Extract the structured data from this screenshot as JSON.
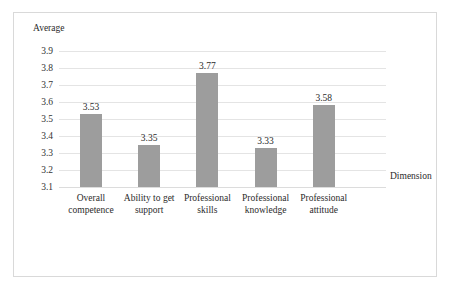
{
  "chart_data": {
    "type": "bar",
    "title": "",
    "subtitle": "",
    "ylabel": "Average",
    "xlabel": "Dimension",
    "categories": [
      "Overall competence",
      "Ability to get support",
      "Professional skills",
      "Professional knowledge",
      "Professional attitude"
    ],
    "category_lines": [
      [
        "Overall",
        "competence"
      ],
      [
        "Ability to get",
        "support"
      ],
      [
        "Professional",
        "skills"
      ],
      [
        "Professional",
        "knowledge"
      ],
      [
        "Professional",
        "attitude"
      ]
    ],
    "values": [
      3.53,
      3.35,
      3.77,
      3.33,
      3.58
    ],
    "value_labels": [
      "3.53",
      "3.35",
      "3.77",
      "3.33",
      "3.58"
    ],
    "ylim": [
      3.1,
      3.9
    ],
    "ytick_labels": [
      "3.9",
      "3.8",
      "3.7",
      "3.6",
      "3.5",
      "3.4",
      "3.3",
      "3.2",
      "3.1"
    ],
    "ytick_values": [
      3.9,
      3.8,
      3.7,
      3.6,
      3.5,
      3.4,
      3.3,
      3.2,
      3.1
    ],
    "grid": true,
    "legend": false,
    "legend_position": "none",
    "colors": {
      "bar": "#9d9d9d",
      "gridline": "#e4e4e4",
      "text": "#2b2b2b",
      "border": "#d9d9d9",
      "background": "#ffffff"
    }
  }
}
